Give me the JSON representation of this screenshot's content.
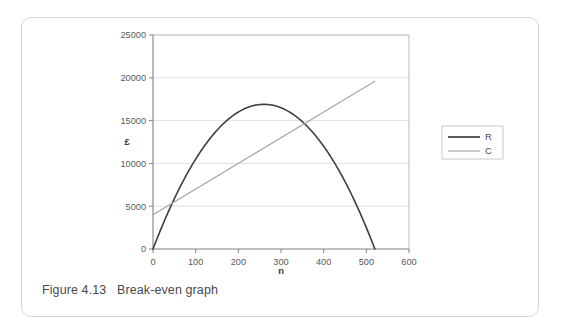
{
  "figure": {
    "caption": "Figure 4.13   Break-even graph"
  },
  "chart_data": {
    "type": "line",
    "title": "",
    "xlabel": "n",
    "ylabel": "£",
    "xlim": [
      0,
      600
    ],
    "ylim": [
      0,
      25000
    ],
    "xticks": [
      0,
      100,
      200,
      300,
      400,
      500,
      600
    ],
    "xtick_labels": [
      "0",
      "100",
      "200",
      "300",
      "400",
      "500",
      "600"
    ],
    "yticks": [
      0,
      5000,
      10000,
      15000,
      20000,
      25000
    ],
    "ytick_labels": [
      "0",
      "5000",
      "10000",
      "15000",
      "20000",
      "25000"
    ],
    "grid": "horizontal",
    "legend_position": "right",
    "series": [
      {
        "name": "R",
        "color": "#3f3f3f",
        "width": 1.6,
        "kind": "parabola",
        "note": "Revenue: R = 65n - 0.125n^2, zero at n=0 and n=520, peak 16900 at n=260",
        "x": [
          0,
          20,
          40,
          60,
          80,
          100,
          120,
          140,
          160,
          180,
          200,
          220,
          240,
          260,
          280,
          300,
          320,
          340,
          360,
          380,
          400,
          420,
          440,
          460,
          480,
          500,
          520
        ],
        "y": [
          0,
          1250,
          2400,
          3450,
          4400,
          5250,
          6000,
          6650,
          7200,
          7650,
          8000,
          8250,
          8400,
          8450,
          8400,
          8250,
          8000,
          7650,
          7200,
          6650,
          6000,
          5250,
          4400,
          3450,
          2400,
          1250,
          0
        ]
      },
      {
        "name": "C",
        "color": "#a8a8a8",
        "width": 1.3,
        "kind": "line",
        "note": "Cost: C = 4000 + 30n, from (0,4000) to (520,19600)",
        "x": [
          0,
          520
        ],
        "y": [
          4000,
          19600
        ]
      }
    ],
    "annotations": {
      "break_even_1": {
        "n": 45,
        "value": 5350
      },
      "break_even_2": {
        "n": 355,
        "value": 14650
      },
      "max_revenue": {
        "n": 260,
        "value": 16900
      }
    }
  },
  "legend": {
    "items": [
      {
        "label": "R",
        "color": "#3f3f3f"
      },
      {
        "label": "C",
        "color": "#a8a8a8"
      }
    ]
  }
}
